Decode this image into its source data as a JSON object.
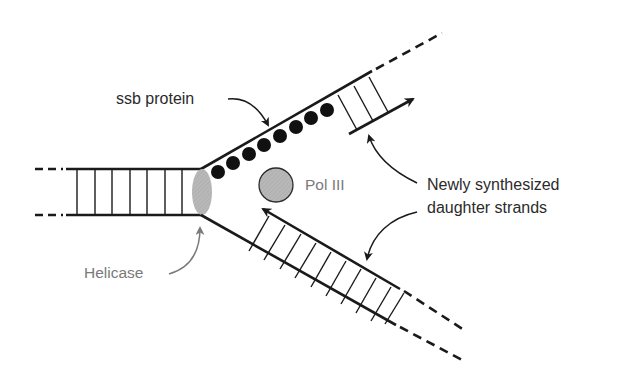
{
  "figure": {
    "labels": {
      "ssb": "ssb protein",
      "pol": "Pol III",
      "newly_line1": "Newly synthesized",
      "newly_line2": "daughter strands",
      "helicase": "Helicase"
    },
    "components": [
      {
        "name": "parental duplex",
        "rungs": 7
      },
      {
        "name": "helicase",
        "shape": "ellipse",
        "color": "#b5b5b5"
      },
      {
        "name": "ssb protein",
        "shape": "circles",
        "count": 9,
        "color": "#111111"
      },
      {
        "name": "Pol III",
        "shape": "circle",
        "color": "#b5b5b5"
      },
      {
        "name": "upper daughter strand",
        "rungs": 3,
        "direction": "right"
      },
      {
        "name": "lower daughter strand",
        "rungs": 10,
        "direction": "left"
      }
    ],
    "colors": {
      "strand": "#1a1a1a",
      "protein_gray": "#b5b5b5",
      "label_dark": "#2b2b2b",
      "label_gray": "#7a7a7a"
    }
  }
}
